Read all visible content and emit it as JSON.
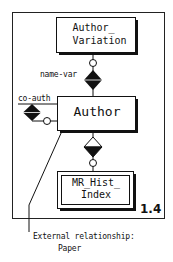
{
  "diagram": {
    "figure_number": "1.4",
    "entities": [
      {
        "id": "author_variation",
        "line1": "Author_",
        "line2": "Variation",
        "style": "shadowed"
      },
      {
        "id": "author",
        "label": "Author",
        "style": "shadowed"
      },
      {
        "id": "mr_hist_index",
        "line1": "MR_Hist_",
        "line2": "Index",
        "style": "double-border"
      }
    ],
    "relationships": [
      {
        "label": "name-var",
        "from": "Author",
        "to": "Author_Variation",
        "symbol": "filled-diamond",
        "optional_circle": true
      },
      {
        "label": "co-auth",
        "from": "Author",
        "to": "Author",
        "symbol": "filled-diamond",
        "optional_circle": true
      },
      {
        "label": "",
        "from": "Author",
        "to": "MR_Hist_Index",
        "symbol": "half-filled-diamond",
        "optional_circle": true
      }
    ],
    "annotation": {
      "line1": "External relationship:",
      "line2": "Paper"
    }
  }
}
